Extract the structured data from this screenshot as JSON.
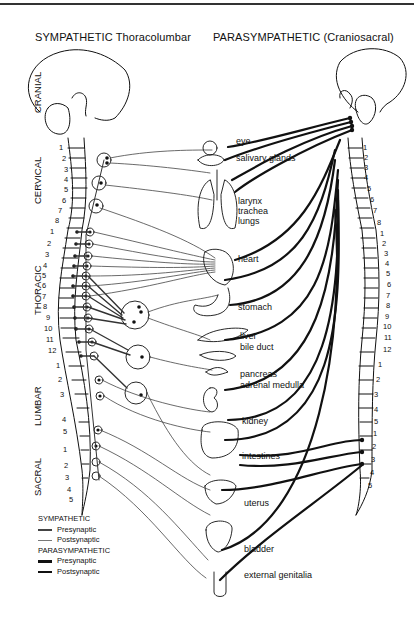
{
  "titles": {
    "sympathetic": "SYMPATHETIC Thoracolumbar",
    "parasympathetic": "PARASYMPATHETIC (Craniosacral)"
  },
  "regions": [
    "CRANIAL",
    "CERVICAL",
    "THORACIC",
    "LUMBAR",
    "SACRAL"
  ],
  "organs": {
    "eye": "eye",
    "salivary": "salivary glands",
    "larynx": "larynx",
    "trachea": "trachea",
    "lungs": "lungs",
    "heart": "heart",
    "stomach": "stomach",
    "liver": "liver",
    "bile": "bile duct",
    "pancreas": "pancreas",
    "adrenal": "adrenal medulla",
    "kidney": "kidney",
    "intestines": "intestines",
    "uterus": "uterus",
    "bladder": "bladder",
    "genitalia": "external genitalia"
  },
  "vertebrae": {
    "cervical": [
      "1",
      "2",
      "3",
      "4",
      "5",
      "6",
      "7",
      "8"
    ],
    "thoracic": [
      "1",
      "2",
      "3",
      "4",
      "5",
      "6",
      "7",
      "8",
      "9",
      "10",
      "11",
      "12"
    ],
    "lumbar": [
      "1",
      "2",
      "3",
      "4",
      "5"
    ],
    "sacral": [
      "1",
      "2",
      "3",
      "4",
      "5"
    ]
  },
  "legend": {
    "sympathetic_title": "SYMPATHETIC",
    "sym_pre": "Presynaptic",
    "sym_post": "Postsynaptic",
    "parasympathetic_title": "PARASYMPATHETIC",
    "para_pre": "Presynaptic",
    "para_post": "Postsynaptic"
  }
}
